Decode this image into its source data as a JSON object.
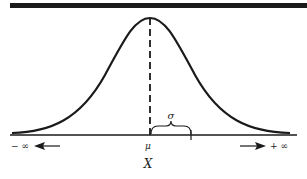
{
  "diagram": {
    "type": "normal-distribution",
    "labels": {
      "mean": "μ",
      "std_dev": "σ",
      "axis_variable": "X",
      "neg_infinity": "− ∞",
      "pos_infinity": "+ ∞"
    }
  }
}
